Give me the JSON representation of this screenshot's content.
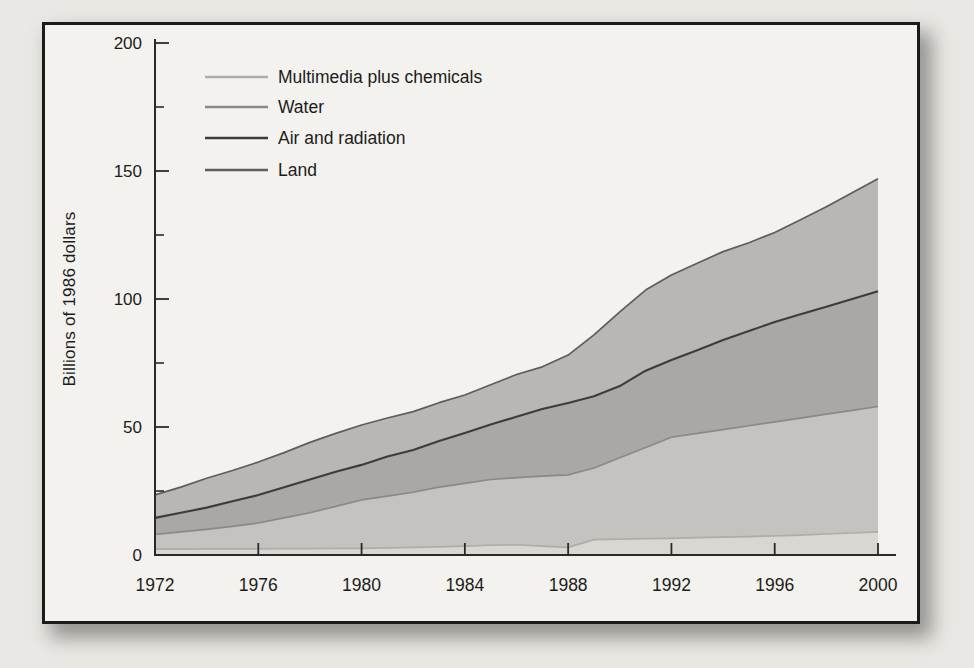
{
  "figure": {
    "page_background": "#e9e8e4",
    "frame_background": "#f3f2ee",
    "frame_border_color": "#1b1b1a",
    "axis_color": "#2a2a28",
    "text_color": "#1c1c1b"
  },
  "chart_data": {
    "type": "area",
    "stacked": true,
    "title": "",
    "xlabel": "",
    "ylabel": "Billions of 1986 dollars",
    "xlim": [
      1972,
      2000
    ],
    "ylim": [
      0,
      200
    ],
    "grid": false,
    "legend_position": "top-left",
    "x": [
      1972,
      1973,
      1974,
      1975,
      1976,
      1977,
      1978,
      1979,
      1980,
      1981,
      1982,
      1983,
      1984,
      1985,
      1986,
      1987,
      1988,
      1989,
      1990,
      1991,
      1992,
      1993,
      1994,
      1995,
      1996,
      1997,
      1998,
      1999,
      2000
    ],
    "x_ticks": [
      1972,
      1976,
      1980,
      1984,
      1988,
      1992,
      1996,
      2000
    ],
    "y_ticks": [
      0,
      50,
      100,
      150,
      200
    ],
    "y_minor_ticks": [
      25,
      75,
      125,
      175
    ],
    "series": [
      {
        "name": "Multimedia plus chemicals",
        "values": [
          2.3,
          2.3,
          2.4,
          2.4,
          2.4,
          2.5,
          2.5,
          2.6,
          2.6,
          2.8,
          3.0,
          3.2,
          3.5,
          3.8,
          4.0,
          3.5,
          3.0,
          6.0,
          6.2,
          6.4,
          6.5,
          6.8,
          7.0,
          7.2,
          7.5,
          7.8,
          8.2,
          8.6,
          9.0
        ],
        "fill_color": "#d8d7d2",
        "line_color": "#aeada9"
      },
      {
        "name": "Water",
        "values": [
          5.7,
          6.7,
          7.6,
          8.8,
          10.1,
          12.0,
          14.0,
          16.4,
          18.9,
          20.2,
          21.5,
          23.3,
          24.5,
          25.7,
          26.2,
          27.3,
          28.3,
          28.0,
          31.8,
          35.6,
          39.5,
          40.7,
          42.0,
          43.3,
          44.5,
          45.7,
          46.8,
          47.9,
          49.0
        ],
        "fill_color": "#c4c3bf",
        "line_color": "#8a8985"
      },
      {
        "name": "Air and radiation",
        "values": [
          6.5,
          7.5,
          8.5,
          9.8,
          10.9,
          12.0,
          13.0,
          13.5,
          13.7,
          15.5,
          16.5,
          18.0,
          19.7,
          21.5,
          23.8,
          26.2,
          28.1,
          28.0,
          28.0,
          30.0,
          30.2,
          32.5,
          35.0,
          37.0,
          39.0,
          40.5,
          42.0,
          43.5,
          45.0
        ],
        "fill_color": "#a9a8a4",
        "line_color": "#3c3c39"
      },
      {
        "name": "Land",
        "values": [
          9.0,
          10.0,
          11.5,
          12.0,
          12.9,
          13.5,
          14.5,
          15.0,
          15.6,
          15.0,
          15.0,
          15.0,
          14.8,
          15.5,
          16.5,
          16.5,
          18.7,
          24.0,
          29.0,
          31.5,
          33.2,
          34.0,
          34.5,
          34.5,
          35.0,
          37.0,
          39.0,
          41.5,
          44.0
        ],
        "fill_color": "#b8b7b3",
        "line_color": "#5e5d5a"
      }
    ]
  }
}
